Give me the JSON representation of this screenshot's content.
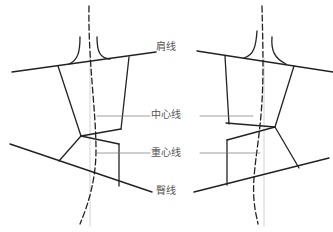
{
  "figure": {
    "type": "pattern-diagram",
    "labels": [
      {
        "id": "shoulder",
        "text": "肩线",
        "x": 166,
        "y": 41
      },
      {
        "id": "center",
        "text": "中心线",
        "x": 166,
        "y": 109
      },
      {
        "id": "gravity",
        "text": "重心线",
        "x": 166,
        "y": 147
      },
      {
        "id": "hip",
        "text": "臀线",
        "x": 166,
        "y": 185
      }
    ],
    "colors": {
      "stroke": "#222222",
      "guide": "#bbbbbb",
      "leader": "#666666",
      "text": "#555555"
    }
  }
}
